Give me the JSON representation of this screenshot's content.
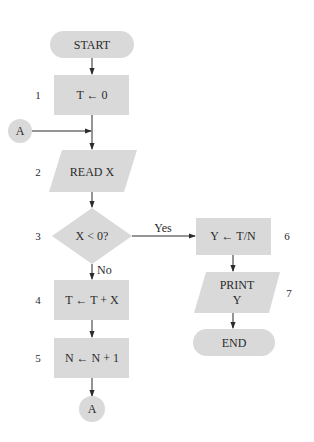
{
  "flowchart": {
    "colors": {
      "shape_fill": "#d9d9d9",
      "line": "#2b2b2b",
      "background": "#ffffff"
    },
    "nodes": {
      "start": {
        "type": "terminal",
        "label": "START"
      },
      "step1": {
        "type": "process",
        "label": "T ← 0",
        "number": "1"
      },
      "connector_in": {
        "type": "connector",
        "label": "A"
      },
      "step2": {
        "type": "input",
        "label": "READ X",
        "number": "2"
      },
      "step3": {
        "type": "decision",
        "label": "X < 0?",
        "number": "3"
      },
      "step4": {
        "type": "process",
        "label": "T ← T + X",
        "number": "4"
      },
      "step5": {
        "type": "process",
        "label": "N ← N + 1",
        "number": "5"
      },
      "connector_out": {
        "type": "connector",
        "label": "A"
      },
      "step6": {
        "type": "process",
        "label": "Y ← T/N",
        "number": "6"
      },
      "step7": {
        "type": "output",
        "label_line1": "PRINT",
        "label_line2": "Y",
        "number": "7"
      },
      "end": {
        "type": "terminal",
        "label": "END"
      }
    },
    "edges": {
      "yes_label": "Yes",
      "no_label": "No"
    }
  }
}
